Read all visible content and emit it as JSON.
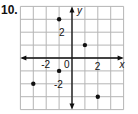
{
  "problem_number": "10.",
  "chart_data": {
    "type": "scatter",
    "title": "",
    "xlabel": "x",
    "ylabel": "y",
    "xlim": [
      -4,
      4
    ],
    "ylim": [
      -4,
      4
    ],
    "grid": true,
    "x_tick_labels": [
      "-2",
      "2"
    ],
    "y_tick_labels": [
      "2",
      "-2"
    ],
    "origin_label": "0",
    "points": [
      {
        "x": -1,
        "y": 3
      },
      {
        "x": 1,
        "y": 1
      },
      {
        "x": -1,
        "y": -1
      },
      {
        "x": -3,
        "y": -2
      },
      {
        "x": 2,
        "y": -3
      }
    ]
  },
  "colors": {
    "grid": "#b5b5b5",
    "axis": "#111111",
    "point": "#111111"
  }
}
